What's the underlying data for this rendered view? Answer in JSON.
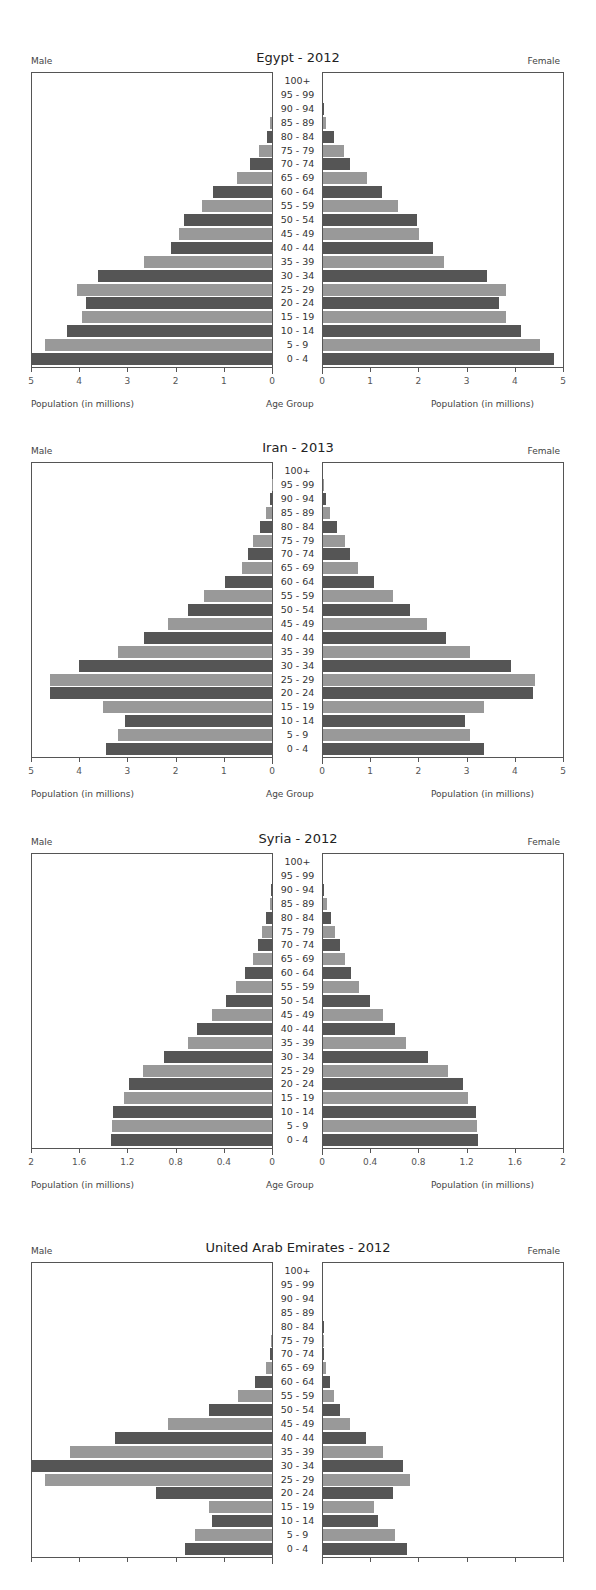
{
  "age_groups": [
    "100+",
    "95 - 99",
    "90 - 94",
    "85 - 89",
    "80 - 84",
    "75 - 79",
    "70 - 74",
    "65 - 69",
    "60 - 64",
    "55 - 59",
    "50 - 54",
    "45 - 49",
    "40 - 44",
    "35 - 39",
    "30 - 34",
    "25 - 29",
    "20 - 24",
    "15 - 19",
    "10 - 14",
    "5 - 9",
    "0 - 4"
  ],
  "labels": {
    "male": "Male",
    "female": "Female",
    "xlabel": "Population (in millions)",
    "center_label": "Age Group"
  },
  "colors": {
    "dark": "#555555",
    "light": "#999999",
    "axis": "#555555"
  },
  "chart_data": [
    {
      "type": "bar",
      "title": "Egypt - 2012",
      "xlabel": "Population (in millions)",
      "ylabel": "Age Group",
      "xlim": [
        0,
        5
      ],
      "ticks": [
        "0",
        "1",
        "2",
        "3",
        "4",
        "5"
      ],
      "categories": [
        "100+",
        "95 - 99",
        "90 - 94",
        "85 - 89",
        "80 - 84",
        "75 - 79",
        "70 - 74",
        "65 - 69",
        "60 - 64",
        "55 - 59",
        "50 - 54",
        "45 - 49",
        "40 - 44",
        "35 - 39",
        "30 - 34",
        "25 - 29",
        "20 - 24",
        "15 - 19",
        "10 - 14",
        "5 - 9",
        "0 - 4"
      ],
      "series": [
        {
          "name": "Male",
          "values": [
            0,
            0,
            0.01,
            0.04,
            0.1,
            0.28,
            0.45,
            0.72,
            1.22,
            1.45,
            1.82,
            1.92,
            2.1,
            2.65,
            3.6,
            4.05,
            3.85,
            3.95,
            4.25,
            4.7,
            5.0
          ]
        },
        {
          "name": "Female",
          "values": [
            0,
            0,
            0.01,
            0.06,
            0.22,
            0.44,
            0.57,
            0.92,
            1.22,
            1.55,
            1.95,
            2.0,
            2.28,
            2.5,
            3.4,
            3.8,
            3.65,
            3.8,
            4.1,
            4.5,
            4.8
          ]
        }
      ]
    },
    {
      "type": "bar",
      "title": "Iran - 2013",
      "xlabel": "Population (in millions)",
      "ylabel": "Age Group",
      "xlim": [
        0,
        5
      ],
      "ticks": [
        "0",
        "1",
        "2",
        "3",
        "4",
        "5"
      ],
      "categories": [
        "100+",
        "95 - 99",
        "90 - 94",
        "85 - 89",
        "80 - 84",
        "75 - 79",
        "70 - 74",
        "65 - 69",
        "60 - 64",
        "55 - 59",
        "50 - 54",
        "45 - 49",
        "40 - 44",
        "35 - 39",
        "30 - 34",
        "25 - 29",
        "20 - 24",
        "15 - 19",
        "10 - 14",
        "5 - 9",
        "0 - 4"
      ],
      "series": [
        {
          "name": "Male",
          "values": [
            0,
            0.01,
            0.05,
            0.13,
            0.24,
            0.4,
            0.5,
            0.63,
            0.97,
            1.42,
            1.75,
            2.15,
            2.65,
            3.2,
            4.0,
            4.6,
            4.6,
            3.5,
            3.05,
            3.2,
            3.45
          ]
        },
        {
          "name": "Female",
          "values": [
            0,
            0.01,
            0.06,
            0.15,
            0.3,
            0.45,
            0.55,
            0.73,
            1.05,
            1.45,
            1.8,
            2.15,
            2.55,
            3.05,
            3.9,
            4.4,
            4.35,
            3.35,
            2.95,
            3.05,
            3.35
          ]
        }
      ]
    },
    {
      "type": "bar",
      "title": "Syria - 2012",
      "xlabel": "Population (in millions)",
      "ylabel": "Age Group",
      "xlim": [
        0,
        2
      ],
      "ticks": [
        "0",
        "0.4",
        "0.8",
        "1.2",
        "1.6",
        "2"
      ],
      "categories": [
        "100+",
        "95 - 99",
        "90 - 94",
        "85 - 89",
        "80 - 84",
        "75 - 79",
        "70 - 74",
        "65 - 69",
        "60 - 64",
        "55 - 59",
        "50 - 54",
        "45 - 49",
        "40 - 44",
        "35 - 39",
        "30 - 34",
        "25 - 29",
        "20 - 24",
        "15 - 19",
        "10 - 14",
        "5 - 9",
        "0 - 4"
      ],
      "series": [
        {
          "name": "Male",
          "values": [
            0,
            0,
            0.005,
            0.02,
            0.05,
            0.08,
            0.12,
            0.16,
            0.22,
            0.3,
            0.38,
            0.5,
            0.62,
            0.7,
            0.9,
            1.07,
            1.19,
            1.23,
            1.32,
            1.33,
            1.34
          ]
        },
        {
          "name": "Female",
          "values": [
            0,
            0,
            0.005,
            0.03,
            0.07,
            0.1,
            0.14,
            0.18,
            0.23,
            0.3,
            0.39,
            0.5,
            0.6,
            0.69,
            0.87,
            1.04,
            1.16,
            1.2,
            1.27,
            1.28,
            1.29
          ]
        }
      ]
    },
    {
      "type": "bar",
      "title": "United Arab Emirates - 2012",
      "xlabel": "Population (in millions)",
      "ylabel": "Age Group",
      "xlim": [
        0,
        1
      ],
      "ticks": [],
      "categories": [
        "100+",
        "95 - 99",
        "90 - 94",
        "85 - 89",
        "80 - 84",
        "75 - 79",
        "70 - 74",
        "65 - 69",
        "60 - 64",
        "55 - 59",
        "50 - 54",
        "45 - 49",
        "40 - 44",
        "35 - 39",
        "30 - 34",
        "25 - 29",
        "20 - 24",
        "15 - 19",
        "10 - 14",
        "5 - 9",
        "0 - 4"
      ],
      "series": [
        {
          "name": "Male",
          "values": [
            0,
            0,
            0,
            0,
            0.002,
            0.004,
            0.01,
            0.025,
            0.07,
            0.14,
            0.26,
            0.43,
            0.65,
            0.84,
            1.0,
            0.94,
            0.48,
            0.26,
            0.25,
            0.32,
            0.36
          ]
        },
        {
          "name": "Female",
          "values": [
            0,
            0,
            0,
            0,
            0.002,
            0.004,
            0.006,
            0.012,
            0.03,
            0.045,
            0.07,
            0.11,
            0.18,
            0.25,
            0.33,
            0.36,
            0.29,
            0.21,
            0.23,
            0.3,
            0.35
          ]
        }
      ]
    }
  ]
}
